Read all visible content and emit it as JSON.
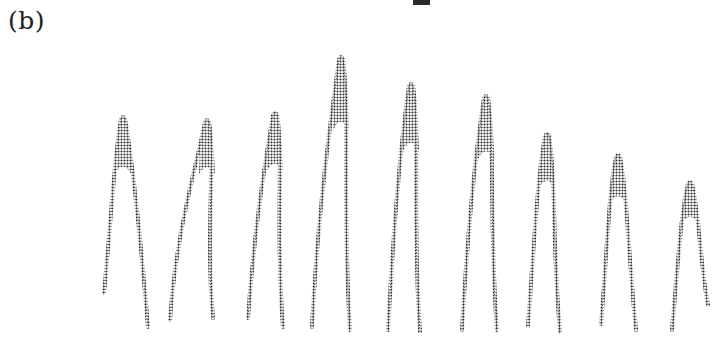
{
  "figure": {
    "panel_label": "(b)",
    "colors": {
      "ink": "#333333",
      "background": "#ffffff",
      "mark": "#2a2a2a"
    }
  },
  "chart_data": {
    "type": "line",
    "title": "",
    "xlabel": "",
    "ylabel": "",
    "grid": false,
    "legend": null,
    "peaks": [
      {
        "index": 1,
        "apex_x": 123,
        "apex_y": 117,
        "left_x": 104,
        "left_y": 293,
        "right_x": 148,
        "right_y": 327,
        "height": 210
      },
      {
        "index": 2,
        "apex_x": 207,
        "apex_y": 120,
        "left_x": 170,
        "left_y": 320,
        "right_x": 213,
        "right_y": 318,
        "height": 207
      },
      {
        "index": 3,
        "apex_x": 275,
        "apex_y": 113,
        "left_x": 248,
        "left_y": 318,
        "right_x": 283,
        "right_y": 327,
        "height": 214
      },
      {
        "index": 4,
        "apex_x": 341,
        "apex_y": 57,
        "left_x": 312,
        "left_y": 327,
        "right_x": 350,
        "right_y": 330,
        "height": 270
      },
      {
        "index": 5,
        "apex_x": 411,
        "apex_y": 84,
        "left_x": 388,
        "left_y": 330,
        "right_x": 420,
        "right_y": 332,
        "height": 243
      },
      {
        "index": 6,
        "apex_x": 486,
        "apex_y": 96,
        "left_x": 462,
        "left_y": 330,
        "right_x": 497,
        "right_y": 330,
        "height": 231
      },
      {
        "index": 7,
        "apex_x": 547,
        "apex_y": 134,
        "left_x": 528,
        "left_y": 326,
        "right_x": 560,
        "right_y": 332,
        "height": 193
      },
      {
        "index": 8,
        "apex_x": 618,
        "apex_y": 155,
        "left_x": 601,
        "left_y": 324,
        "right_x": 636,
        "right_y": 330,
        "height": 172
      },
      {
        "index": 9,
        "apex_x": 690,
        "apex_y": 182,
        "left_x": 672,
        "left_y": 330,
        "right_x": 708,
        "right_y": 305,
        "height": 145
      }
    ],
    "x": [
      1,
      2,
      3,
      4,
      5,
      6,
      7,
      8,
      9
    ],
    "values": [
      210,
      207,
      214,
      270,
      243,
      231,
      193,
      172,
      145
    ]
  }
}
